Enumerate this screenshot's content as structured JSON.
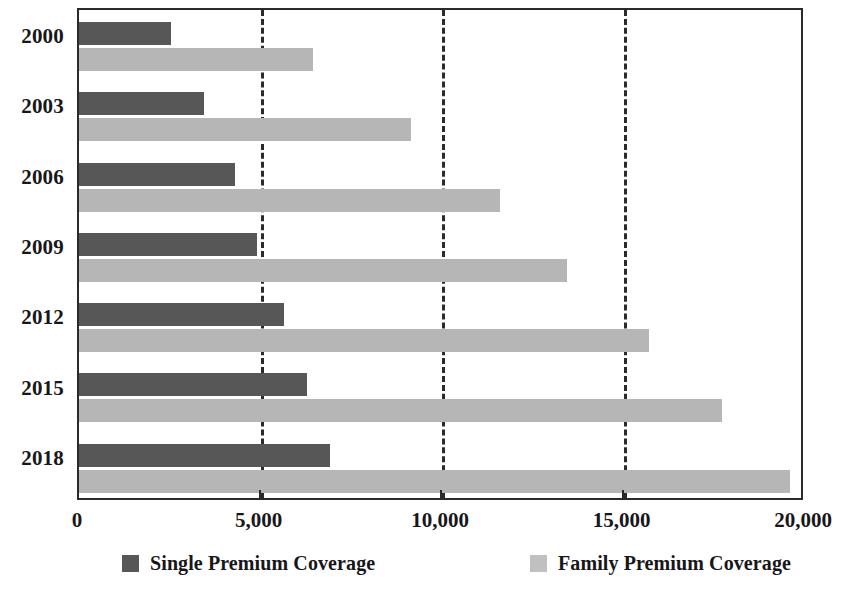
{
  "chart_data": {
    "type": "bar",
    "orientation": "horizontal",
    "title": "",
    "subtitle": "",
    "xlabel": "",
    "ylabel": "",
    "categories": [
      "2000",
      "2003",
      "2006",
      "2009",
      "2012",
      "2015",
      "2018"
    ],
    "series": [
      {
        "name": "Single Premium Coverage",
        "color": "#575757",
        "values": [
          2530,
          3440,
          4310,
          4890,
          5660,
          6290,
          6920
        ]
      },
      {
        "name": "Family Premium Coverage",
        "color": "#b6b6b6",
        "values": [
          6440,
          9150,
          11600,
          13430,
          15700,
          17700,
          19600
        ]
      }
    ],
    "xlim": [
      0,
      20000
    ],
    "xticks": [
      0,
      5000,
      10000,
      15000,
      20000
    ],
    "xtick_labels": [
      "0",
      "5,000",
      "10,000",
      "15,000",
      "20,000"
    ],
    "gridlines": [
      5000,
      10000,
      15000
    ],
    "grid": true,
    "grid_style": "dashed",
    "legend_position": "bottom"
  },
  "legend": {
    "entries": [
      {
        "label": "Single Premium Coverage",
        "swatch": "single"
      },
      {
        "label": "Family Premium Coverage",
        "swatch": "family"
      }
    ]
  }
}
